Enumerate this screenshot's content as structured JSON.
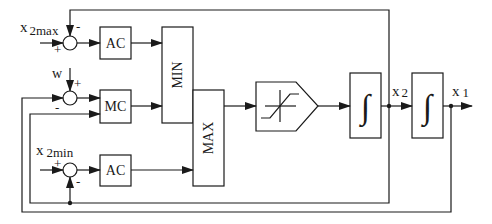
{
  "diagram": {
    "type": "block-diagram",
    "blocks": {
      "ac_top": {
        "label": "AC"
      },
      "mc": {
        "label": "MC"
      },
      "ac_bottom": {
        "label": "AC"
      },
      "min": {
        "label": "MIN"
      },
      "max": {
        "label": "MAX"
      },
      "saturation": {
        "label": "saturation"
      },
      "integrator1": {
        "label": "∫"
      },
      "integrator2": {
        "label": "∫"
      }
    },
    "signals": {
      "x2max": {
        "main": "x",
        "sub": "2max"
      },
      "w": {
        "main": "w"
      },
      "x2min": {
        "main": "x",
        "sub": "2min"
      },
      "x2": {
        "main": "x",
        "sub": "2"
      },
      "x1": {
        "main": "x",
        "sub": "1"
      }
    },
    "signs": {
      "sum1_top": "-",
      "sum1_left": "+",
      "sum2_top": "+",
      "sum2_left": "-",
      "sum3_left": "+",
      "sum3_bottom": "-"
    },
    "colors": {
      "stroke": "#1a1a1a",
      "background": "#ffffff"
    }
  }
}
